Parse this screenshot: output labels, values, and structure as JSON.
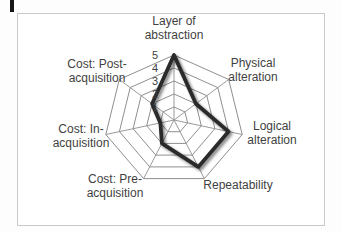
{
  "chart_data": {
    "type": "radar",
    "title": "",
    "categories": [
      "Layer of abstraction",
      "Physical alteration",
      "Logical alteration",
      "Repeatability",
      "Cost: Pre-acquisition",
      "Cost: In-acquisition",
      "Cost: Post-acquisition"
    ],
    "series": [
      {
        "name": "rating",
        "values": [
          5,
          2,
          4,
          4,
          2,
          1,
          2
        ]
      }
    ],
    "axis_range": [
      0,
      5
    ],
    "tick_labels": [
      "5",
      "4",
      "3",
      "2",
      "1"
    ],
    "rings": 5,
    "grid": "on",
    "legend": "none",
    "grid_color": "#8f8f8f",
    "series_color": "#2b2b2b",
    "label_color": "#3f3f3f",
    "panel_border_color": "#c9c9c9"
  },
  "labels": {
    "layer": [
      "Layer of",
      "abstraction"
    ],
    "physical": [
      "Physical",
      "alteration"
    ],
    "logical": [
      "Logical",
      "alteration"
    ],
    "repeatability": [
      "Repeatability"
    ],
    "pre": [
      "Cost: Pre-",
      "acquisition"
    ],
    "in": [
      "Cost: In-",
      "acquisition"
    ],
    "post": [
      "Cost: Post-",
      "acquisition"
    ]
  }
}
